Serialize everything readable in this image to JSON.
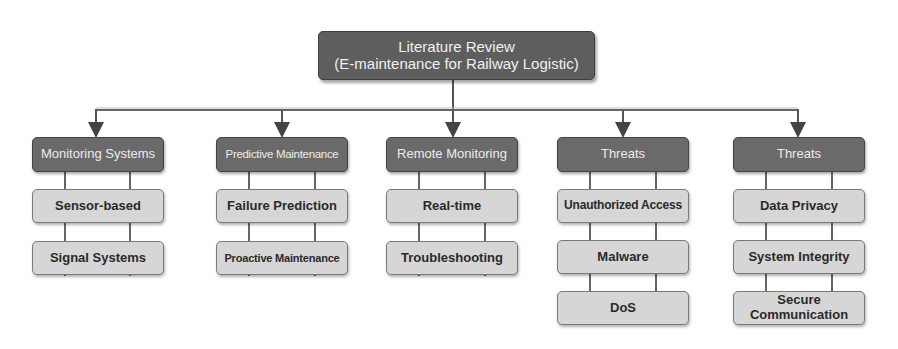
{
  "root": {
    "line1": "Literature Review",
    "line2": "(E-maintenance for Railway Logistic)"
  },
  "columns": [
    {
      "header": "Monitoring Systems",
      "items": [
        "Sensor-based",
        "Signal Systems"
      ]
    },
    {
      "header": "Predictive Maintenance",
      "items": [
        "Failure Prediction",
        "Proactive Maintenance"
      ]
    },
    {
      "header": "Remote Monitoring",
      "items": [
        "Real-time",
        "Troubleshooting"
      ]
    },
    {
      "header": "Threats",
      "items": [
        "Unauthorized Access",
        "Malware",
        "DoS"
      ]
    },
    {
      "header": "Threats",
      "items": [
        "Data Privacy",
        "System Integrity",
        "Secure Communication"
      ]
    }
  ],
  "colors": {
    "root_fill": "#5e5e5e",
    "header_fill": "#6a6a6a",
    "leaf_fill": "#d6d6d6",
    "connector": "#555555"
  }
}
